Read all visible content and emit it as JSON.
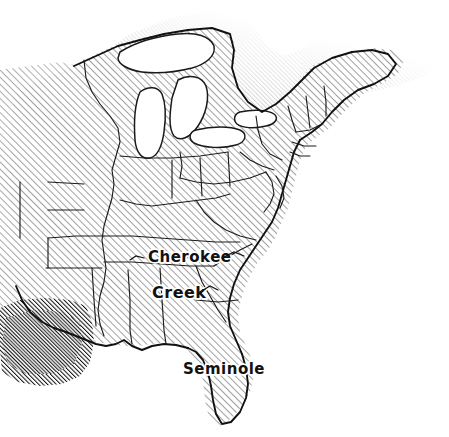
{
  "map": {
    "title": "Eastern United States tribal territories",
    "medium": "pen-and-ink hand-drawn sketch",
    "background_color": "#ffffff",
    "ink_color": "#1a1a1a",
    "hatch_color": "#3a3a3a",
    "hatch_angle_degrees": 45,
    "hatch_spacing_px": 5,
    "width": 449,
    "height": 437,
    "labels": [
      {
        "text": "Cherokee",
        "x": 148,
        "y": 262,
        "font_size": 15,
        "has_leader_line": true
      },
      {
        "text": "Creek",
        "x": 152,
        "y": 298,
        "font_size": 16,
        "has_leader_line": true
      },
      {
        "text": "Seminole",
        "x": 183,
        "y": 374,
        "font_size": 15,
        "has_leader_line": false
      }
    ],
    "regions": [
      {
        "name": "land-light-hatch",
        "shading": "light diagonal hatch",
        "description": "United States land area"
      },
      {
        "name": "canada-dark-hatch",
        "shading": "dense dark diagonal hatch",
        "description": "northern territory beyond border"
      },
      {
        "name": "texas-dark-hatch",
        "shading": "dense dark diagonal hatch",
        "description": "southwestern territory"
      },
      {
        "name": "great-lakes",
        "shading": "unshaded white",
        "description": "Great Lakes water bodies"
      },
      {
        "name": "atlantic-ocean",
        "shading": "unshaded white",
        "description": "Atlantic Ocean"
      },
      {
        "name": "gulf-of-mexico",
        "shading": "unshaded white",
        "description": "Gulf of Mexico"
      }
    ]
  }
}
